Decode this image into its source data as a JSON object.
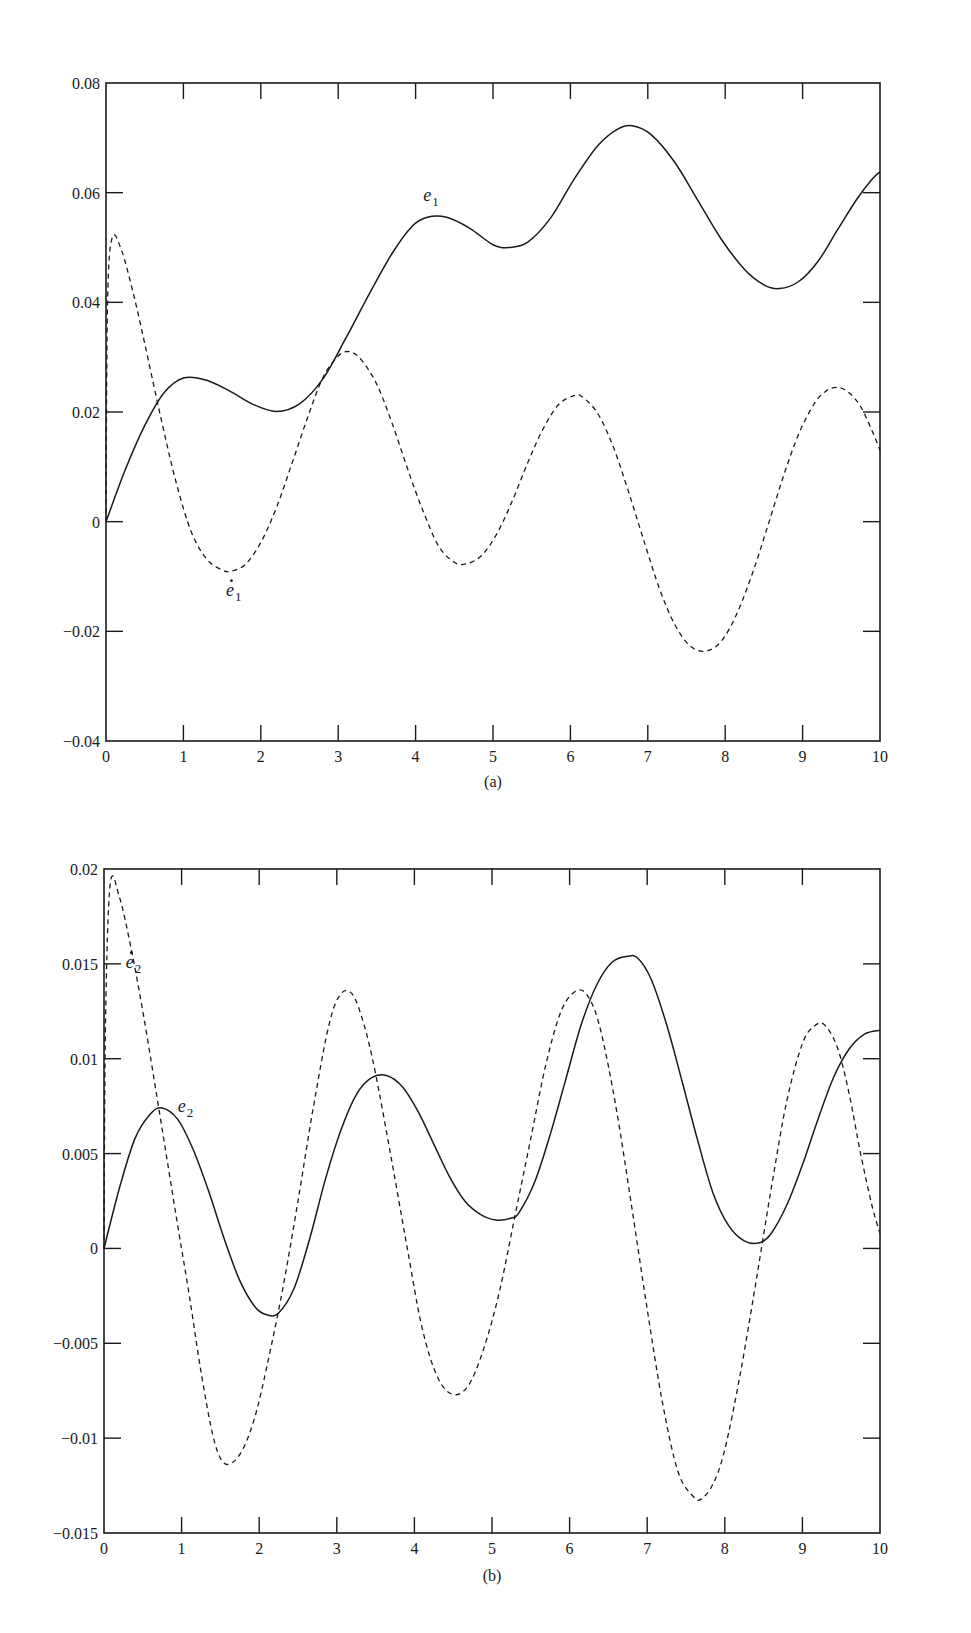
{
  "chart_data": [
    {
      "id": "a",
      "type": "line",
      "title": "",
      "caption": "(a)",
      "xlabel": "",
      "ylabel": "",
      "xlim": [
        0,
        10
      ],
      "ylim": [
        -0.04,
        0.08
      ],
      "grid": false,
      "legend": "none (inline curve labels)",
      "x_ticks": [
        0,
        1,
        2,
        3,
        4,
        5,
        6,
        7,
        8,
        9,
        10
      ],
      "x_tick_labels": [
        "0",
        "1",
        "2",
        "3",
        "4",
        "5",
        "6",
        "7",
        "8",
        "9",
        "10"
      ],
      "y_ticks": [
        -0.04,
        -0.02,
        0,
        0.02,
        0.04,
        0.06,
        0.08
      ],
      "y_tick_labels": [
        "−0.04",
        "−0.02",
        "0",
        "0.02",
        "0.04",
        "0.06",
        "0.08"
      ],
      "series": [
        {
          "name": "e1",
          "label": "e",
          "label_sub": "1",
          "label_dot": false,
          "style": "solid",
          "label_pos": [
            4.1,
            0.0585
          ],
          "x": [
            0,
            0.25,
            0.5,
            0.75,
            1.0,
            1.3,
            1.6,
            1.9,
            2.2,
            2.5,
            2.8,
            3.1,
            3.4,
            3.7,
            3.95,
            4.15,
            4.4,
            4.7,
            5.0,
            5.2,
            5.45,
            5.75,
            6.05,
            6.35,
            6.6,
            6.8,
            7.05,
            7.35,
            7.65,
            7.95,
            8.25,
            8.5,
            8.7,
            8.95,
            9.2,
            9.45,
            9.7,
            9.9,
            10.0
          ],
          "values": [
            0,
            0.0095,
            0.0175,
            0.0235,
            0.0262,
            0.0258,
            0.0238,
            0.0214,
            0.0201,
            0.0215,
            0.026,
            0.0335,
            0.0415,
            0.049,
            0.0538,
            0.0555,
            0.0555,
            0.0535,
            0.0505,
            0.05,
            0.051,
            0.0555,
            0.0625,
            0.0685,
            0.0715,
            0.0722,
            0.0705,
            0.0655,
            0.0585,
            0.0515,
            0.046,
            0.0432,
            0.0425,
            0.0438,
            0.0475,
            0.0532,
            0.0588,
            0.0625,
            0.0638
          ]
        },
        {
          "name": "e1_dot",
          "label": "e",
          "label_sub": "1",
          "label_dot": true,
          "style": "dashed",
          "label_pos": [
            1.55,
            -0.0135
          ],
          "x": [
            0,
            0.02,
            0.08,
            0.2,
            0.35,
            0.5,
            0.7,
            0.9,
            1.1,
            1.3,
            1.5,
            1.62,
            1.8,
            2.0,
            2.2,
            2.4,
            2.6,
            2.8,
            3.0,
            3.15,
            3.3,
            3.5,
            3.7,
            3.9,
            4.1,
            4.3,
            4.5,
            4.65,
            4.85,
            5.05,
            5.25,
            5.45,
            5.65,
            5.85,
            6.05,
            6.15,
            6.35,
            6.55,
            6.75,
            6.95,
            7.15,
            7.35,
            7.55,
            7.75,
            7.95,
            8.15,
            8.35,
            8.55,
            8.75,
            8.95,
            9.15,
            9.3,
            9.45,
            9.6,
            9.75,
            9.9,
            10.0
          ],
          "values": [
            0,
            0.04,
            0.0518,
            0.0495,
            0.0418,
            0.0325,
            0.0195,
            0.0075,
            -0.0018,
            -0.0068,
            -0.0088,
            -0.009,
            -0.0078,
            -0.0038,
            0.0025,
            0.0105,
            0.0188,
            0.0262,
            0.0302,
            0.031,
            0.0295,
            0.025,
            0.0178,
            0.0095,
            0.0018,
            -0.0045,
            -0.0074,
            -0.0077,
            -0.0062,
            -0.0022,
            0.0038,
            0.0108,
            0.017,
            0.0214,
            0.023,
            0.0228,
            0.0198,
            0.0138,
            0.0055,
            -0.0035,
            -0.0122,
            -0.0188,
            -0.0227,
            -0.0236,
            -0.0218,
            -0.0168,
            -0.0095,
            -0.0008,
            0.0082,
            0.016,
            0.0215,
            0.0238,
            0.0245,
            0.0235,
            0.021,
            0.0165,
            0.013
          ]
        }
      ]
    },
    {
      "id": "b",
      "type": "line",
      "title": "",
      "caption": "(b)",
      "xlabel": "",
      "ylabel": "",
      "xlim": [
        0,
        10
      ],
      "ylim": [
        -0.015,
        0.02
      ],
      "grid": false,
      "legend": "none (inline curve labels)",
      "x_ticks": [
        0,
        1,
        2,
        3,
        4,
        5,
        6,
        7,
        8,
        9,
        10
      ],
      "x_tick_labels": [
        "0",
        "1",
        "2",
        "3",
        "4",
        "5",
        "6",
        "7",
        "8",
        "9",
        "10"
      ],
      "y_ticks": [
        -0.015,
        -0.01,
        -0.005,
        0,
        0.005,
        0.01,
        0.015,
        0.02
      ],
      "y_tick_labels": [
        "−0.015",
        "−0.01",
        "−0.005",
        "0",
        "0.005",
        "0.01",
        "0.015",
        "0.02"
      ],
      "series": [
        {
          "name": "e2",
          "label": "e",
          "label_sub": "2",
          "label_dot": false,
          "style": "solid",
          "label_pos": [
            0.95,
            0.0072
          ],
          "x": [
            0,
            0.2,
            0.4,
            0.6,
            0.75,
            0.95,
            1.15,
            1.35,
            1.55,
            1.75,
            1.95,
            2.1,
            2.25,
            2.45,
            2.65,
            2.85,
            3.05,
            3.25,
            3.45,
            3.65,
            3.85,
            4.05,
            4.25,
            4.45,
            4.65,
            4.85,
            5.05,
            5.25,
            5.35,
            5.55,
            5.75,
            5.95,
            6.15,
            6.35,
            6.55,
            6.75,
            6.88,
            7.05,
            7.25,
            7.45,
            7.65,
            7.85,
            8.05,
            8.25,
            8.45,
            8.6,
            8.8,
            9.0,
            9.2,
            9.4,
            9.6,
            9.8,
            10.0
          ],
          "values": [
            0,
            0.0032,
            0.0058,
            0.0071,
            0.0074,
            0.0068,
            0.0052,
            0.003,
            0.0005,
            -0.0017,
            -0.0031,
            -0.0035,
            -0.0034,
            -0.0021,
            0.0005,
            0.0036,
            0.0062,
            0.0081,
            0.009,
            0.0091,
            0.0085,
            0.0072,
            0.0055,
            0.0038,
            0.0025,
            0.0018,
            0.0015,
            0.0016,
            0.0019,
            0.0035,
            0.006,
            0.0089,
            0.0118,
            0.0139,
            0.0151,
            0.0154,
            0.0153,
            0.0142,
            0.0118,
            0.0088,
            0.0057,
            0.0029,
            0.0012,
            0.0004,
            0.0003,
            0.0008,
            0.0023,
            0.0044,
            0.0068,
            0.009,
            0.0105,
            0.0113,
            0.0115
          ]
        },
        {
          "name": "e2_dot",
          "label": "e",
          "label_sub": "2",
          "label_dot": true,
          "style": "dashed",
          "label_pos": [
            0.28,
            0.0148
          ],
          "x": [
            0,
            0.02,
            0.08,
            0.2,
            0.35,
            0.5,
            0.65,
            0.8,
            0.95,
            1.1,
            1.25,
            1.4,
            1.52,
            1.65,
            1.8,
            1.95,
            2.1,
            2.3,
            2.5,
            2.7,
            2.9,
            3.05,
            3.2,
            3.35,
            3.5,
            3.7,
            3.9,
            4.1,
            4.3,
            4.5,
            4.7,
            4.9,
            5.1,
            5.3,
            5.5,
            5.7,
            5.9,
            6.1,
            6.25,
            6.4,
            6.6,
            6.8,
            7.0,
            7.2,
            7.4,
            7.6,
            7.7,
            7.85,
            8.0,
            8.2,
            8.4,
            8.6,
            8.8,
            9.0,
            9.15,
            9.28,
            9.45,
            9.6,
            9.75,
            9.9,
            10.0
          ],
          "values": [
            0,
            0.012,
            0.0192,
            0.0185,
            0.0158,
            0.0125,
            0.0088,
            0.005,
            0.0012,
            -0.0025,
            -0.0065,
            -0.0098,
            -0.0112,
            -0.0113,
            -0.0105,
            -0.0088,
            -0.0062,
            -0.0022,
            0.0025,
            0.0075,
            0.0118,
            0.0134,
            0.0134,
            0.0118,
            0.0092,
            0.0048,
            0.0002,
            -0.0042,
            -0.0068,
            -0.0077,
            -0.0072,
            -0.0052,
            -0.0022,
            0.0018,
            0.0058,
            0.0098,
            0.0126,
            0.0136,
            0.0132,
            0.0115,
            0.0074,
            0.0022,
            -0.0032,
            -0.0082,
            -0.0118,
            -0.0131,
            -0.0132,
            -0.0124,
            -0.0106,
            -0.0066,
            -0.0018,
            0.0032,
            0.0078,
            0.0108,
            0.0117,
            0.0118,
            0.0106,
            0.0082,
            0.005,
            0.0022,
            0.0008
          ]
        }
      ]
    }
  ],
  "figure": {
    "panels": [
      {
        "id": "a",
        "caption": "(a)",
        "curve_labels": {
          "solid": "e1",
          "dashed": "ė1"
        }
      },
      {
        "id": "b",
        "caption": "(b)",
        "curve_labels": {
          "solid": "e2",
          "dashed": "ė2"
        }
      }
    ],
    "colors": {
      "ink": "#1a1a1a",
      "background": "#ffffff"
    }
  }
}
